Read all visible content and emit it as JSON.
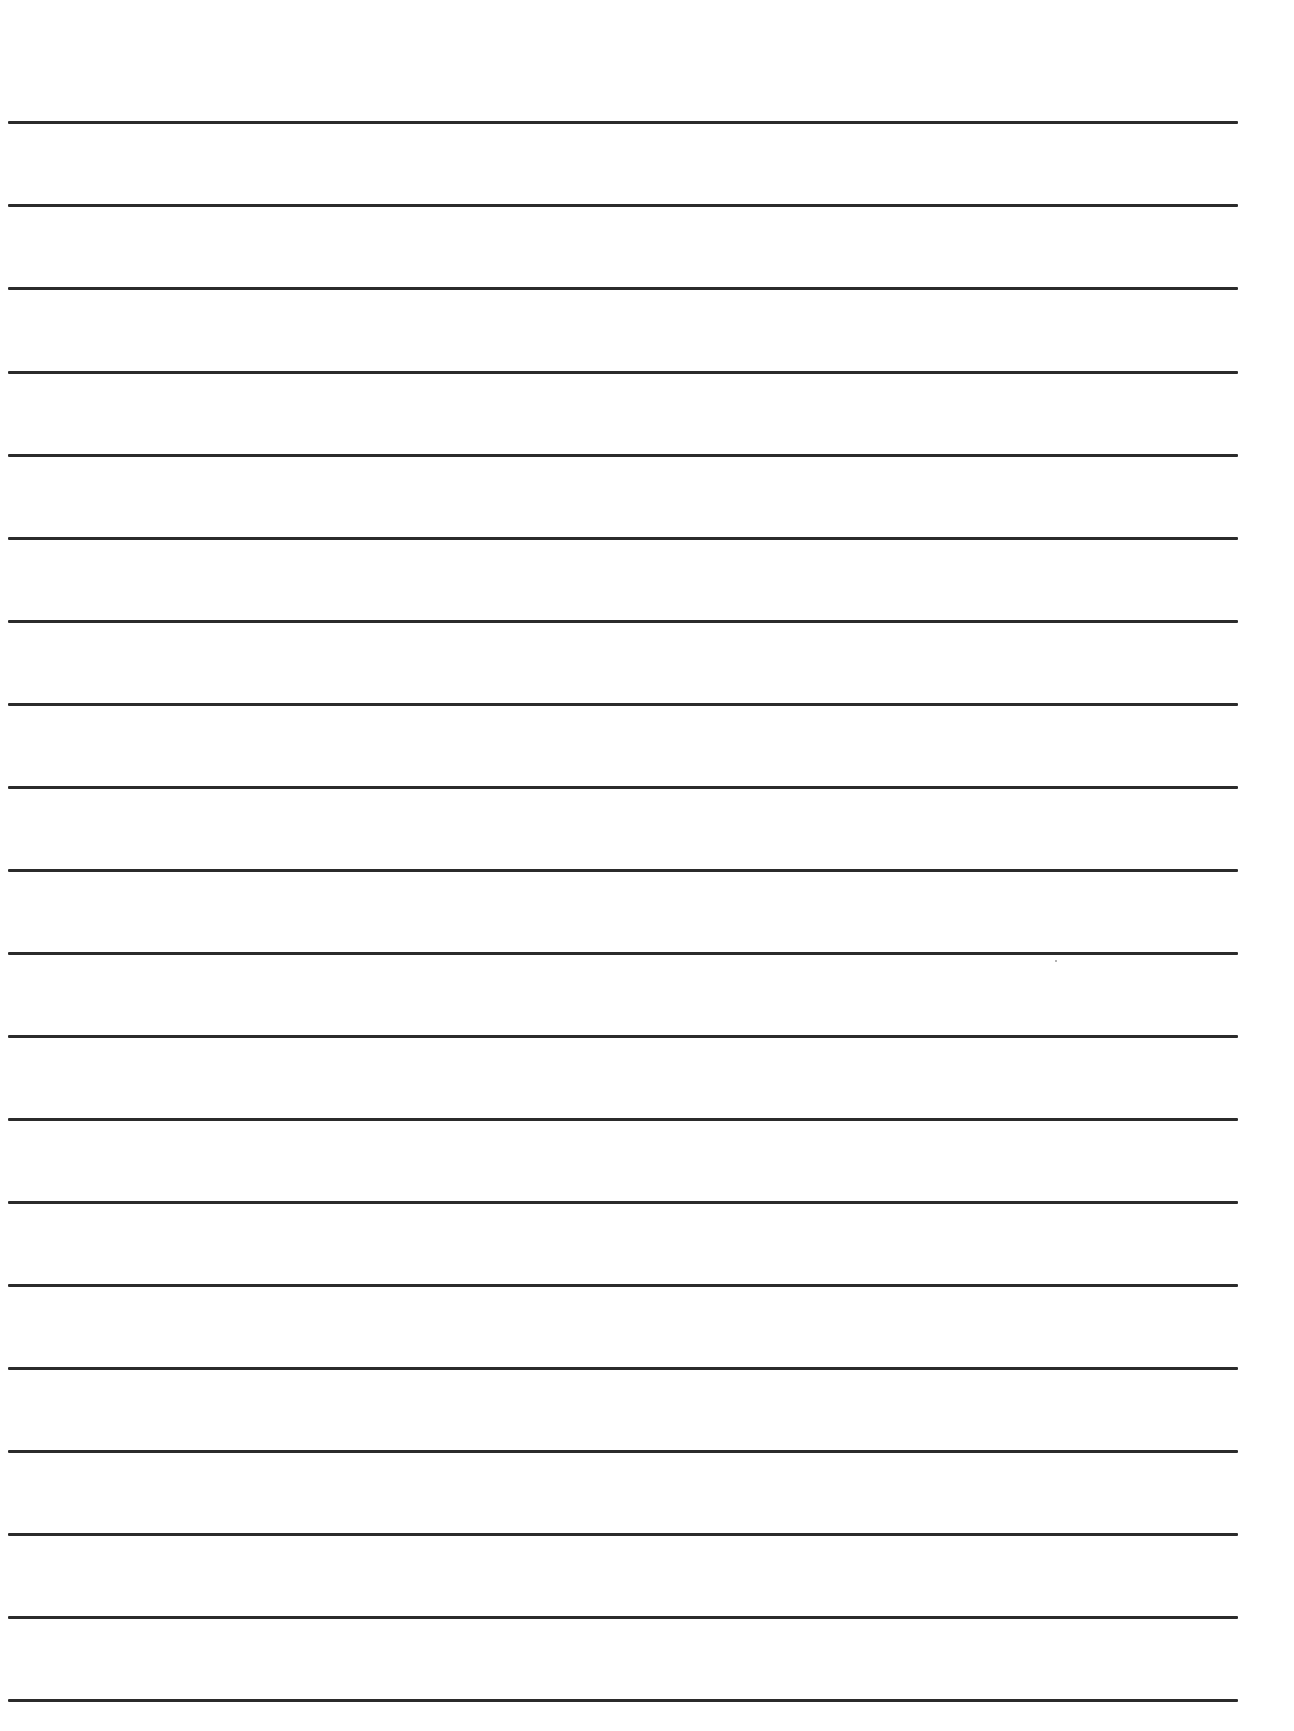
{
  "document": {
    "type": "lined-paper",
    "background_color": "#ffffff",
    "rule_color": "#2b2b2b",
    "rule_count": 20,
    "rules": [
      {
        "y": 121
      },
      {
        "y": 204
      },
      {
        "y": 287
      },
      {
        "y": 371
      },
      {
        "y": 454
      },
      {
        "y": 537
      },
      {
        "y": 620
      },
      {
        "y": 703
      },
      {
        "y": 786
      },
      {
        "y": 869
      },
      {
        "y": 952
      },
      {
        "y": 1035
      },
      {
        "y": 1118
      },
      {
        "y": 1201
      },
      {
        "y": 1284
      },
      {
        "y": 1367
      },
      {
        "y": 1450
      },
      {
        "y": 1533
      },
      {
        "y": 1616
      },
      {
        "y": 1699
      }
    ],
    "specks": [
      {
        "x": 1055,
        "y": 960
      }
    ]
  }
}
